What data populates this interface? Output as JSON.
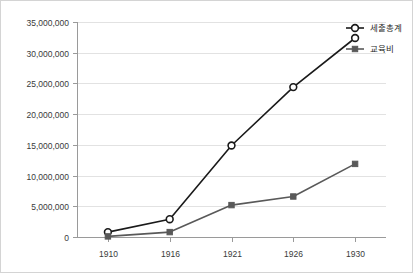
{
  "chart_data": {
    "type": "line",
    "title": "",
    "xlabel": "",
    "ylabel": "",
    "categories": [
      "1910",
      "1916",
      "1921",
      "1926",
      "1930"
    ],
    "ylim": [
      0,
      35000000
    ],
    "ytick_labels": [
      "0",
      "5,000,000",
      "10,000,000",
      "15,000,000",
      "20,000,000",
      "25,000,000",
      "30,000,000",
      "35,000,000"
    ],
    "ytick_values": [
      0,
      5000000,
      10000000,
      15000000,
      20000000,
      25000000,
      30000000,
      35000000
    ],
    "grid": true,
    "legend_position": "top-right",
    "series": [
      {
        "name": "세출총계",
        "marker": "circle-open",
        "color": "#1a1a1a",
        "values": [
          800000,
          2900000,
          14900000,
          24400000,
          32400000
        ]
      },
      {
        "name": "교육비",
        "marker": "square-filled",
        "color": "#595959",
        "values": [
          100000,
          800000,
          5200000,
          6600000,
          11900000
        ]
      }
    ]
  },
  "legend": {
    "items": [
      {
        "label": "세출총계"
      },
      {
        "label": "교육비"
      }
    ]
  },
  "axes": {
    "y_tick_0": "0",
    "y_tick_1": "5,000,000",
    "y_tick_2": "10,000,000",
    "y_tick_3": "15,000,000",
    "y_tick_4": "20,000,000",
    "y_tick_5": "25,000,000",
    "y_tick_6": "30,000,000",
    "y_tick_7": "35,000,000",
    "x_tick_0": "1910",
    "x_tick_1": "1916",
    "x_tick_2": "1921",
    "x_tick_3": "1926",
    "x_tick_4": "1930"
  }
}
